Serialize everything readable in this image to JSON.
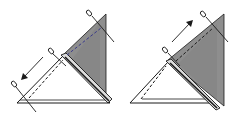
{
  "figure": {
    "panels": [
      {
        "id": "panel-1",
        "description": "Folded triangle pinned at three points; arrow points down-left along the fold",
        "arrow_direction": "down-left",
        "pins": 3
      },
      {
        "id": "panel-2",
        "description": "Folded triangle pinned at two points; arrow points up-right along the fold",
        "arrow_direction": "up-right",
        "pins": 2
      }
    ],
    "colors": {
      "line": "#1a1a1a",
      "shaded": "#8e8e8e",
      "shaded_dark": "#6f6f6f",
      "paper": "#ffffff"
    }
  }
}
